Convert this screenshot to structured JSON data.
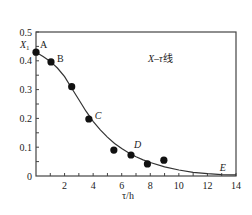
{
  "chart_data": {
    "type": "scatter",
    "title": "",
    "annotation": "X–τ线",
    "xlabel": "τ/h",
    "ylabel": "",
    "xlim": [
      0,
      14
    ],
    "ylim": [
      0,
      0.5
    ],
    "x_ticks": [
      2,
      4,
      6,
      8,
      10,
      12,
      14
    ],
    "y_ticks": [
      0,
      0.1,
      0.2,
      0.3,
      0.4,
      0.5
    ],
    "y_tick_labels": [
      "0",
      "0.1",
      "0.2",
      "0.3",
      "0.4",
      "0.5"
    ],
    "x_tick_labels": [
      "2",
      "4",
      "6",
      "8",
      "10",
      "12",
      "14"
    ],
    "grid": false,
    "y_special_label": "X1",
    "series": [
      {
        "name": "measured points",
        "x": [
          0,
          1.05,
          2.5,
          3.7,
          5.45,
          6.65,
          7.8,
          8.95
        ],
        "y": [
          0.43,
          0.396,
          0.31,
          0.198,
          0.09,
          0.073,
          0.042,
          0.055
        ]
      },
      {
        "name": "fitted curve",
        "x": [
          0,
          0.5,
          1,
          1.5,
          2,
          2.5,
          3,
          3.5,
          4,
          4.5,
          5,
          5.5,
          6,
          6.5,
          7,
          7.5,
          8,
          9,
          10,
          11,
          12,
          13,
          14
        ],
        "y": [
          0.43,
          0.415,
          0.398,
          0.375,
          0.345,
          0.305,
          0.265,
          0.225,
          0.19,
          0.16,
          0.135,
          0.113,
          0.095,
          0.08,
          0.067,
          0.056,
          0.047,
          0.032,
          0.021,
          0.013,
          0.008,
          0.005,
          0.004
        ]
      }
    ],
    "point_labels": [
      {
        "label": "A",
        "x": 0,
        "y": 0.43,
        "italic": false
      },
      {
        "label": "B",
        "x": 1.05,
        "y": 0.396,
        "italic": false
      },
      {
        "label": "C",
        "x": 3.7,
        "y": 0.198,
        "italic": true
      },
      {
        "label": "D",
        "x": 6.65,
        "y": 0.073,
        "italic": true
      },
      {
        "label": "E",
        "x": 13,
        "y": 0.005,
        "italic": true
      }
    ]
  }
}
